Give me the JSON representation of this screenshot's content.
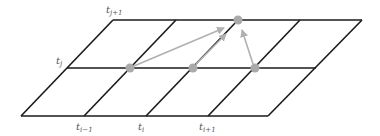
{
  "diagram": {
    "colors": {
      "grid": "#1a1a1a",
      "node": "#aaaaaa",
      "arrow": "#b0b0b0",
      "label": "#555555"
    },
    "labels": {
      "t_j_plus_1": {
        "base": "t",
        "sub": "j+1"
      },
      "t_j": {
        "base": "t",
        "sub": "j"
      },
      "t_i_minus_1": {
        "base": "t",
        "sub": "i−1"
      },
      "t_i": {
        "base": "t",
        "sub": "i"
      },
      "t_i_plus_1": {
        "base": "t",
        "sub": "i+1"
      }
    },
    "nodes": [
      {
        "id": "source-left",
        "x": 130,
        "y": 68
      },
      {
        "id": "source-center",
        "x": 193,
        "y": 68
      },
      {
        "id": "source-right",
        "x": 255,
        "y": 68
      },
      {
        "id": "target-top",
        "x": 238,
        "y": 20
      }
    ]
  }
}
